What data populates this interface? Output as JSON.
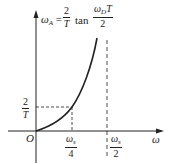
{
  "diagram": {
    "equation": {
      "lhs": "ω",
      "lhs_sub": "A",
      "equals": "=",
      "coef_num": "2",
      "coef_den": "T",
      "func": "tan",
      "arg_num": "ω",
      "arg_num_sub": "D",
      "arg_num_tail": "T",
      "arg_den": "2"
    },
    "y_tick": {
      "num": "2",
      "den": "T"
    },
    "origin": "O",
    "x_axis_label": "ω",
    "x_ticks": [
      {
        "num": "ω",
        "sub": "s",
        "den": "4"
      },
      {
        "num": "ω",
        "sub": "s",
        "den": "2"
      }
    ]
  },
  "colors": {
    "line": "#222222",
    "background": "#ffffff"
  }
}
